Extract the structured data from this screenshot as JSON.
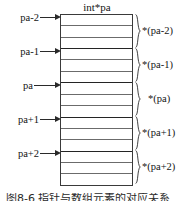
{
  "figure": {
    "title": "int*pa",
    "caption": "图8-6 指针与数组元素的对应关系",
    "colors": {
      "border": "#3a3a3a",
      "cell_line": "#6b6b6b",
      "group_line": "#242424",
      "arrow": "#2a2a2a",
      "brace": "#2f2f2f",
      "text": "#141414",
      "background": "#ffffff"
    }
  },
  "block": {
    "rows_per_group": 3,
    "group_count": 5,
    "total_rows": 15
  },
  "pointers": [
    {
      "label": "pa-2",
      "deref": "*(pa-2)"
    },
    {
      "label": "pa-1",
      "deref": "*(pa-1)"
    },
    {
      "label": "pa",
      "deref": "*(pa)"
    },
    {
      "label": "pa+1",
      "deref": "*(pa+1)"
    },
    {
      "label": "pa+2",
      "deref": "*(pa+2)"
    }
  ]
}
